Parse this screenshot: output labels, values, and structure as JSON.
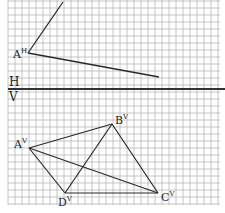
{
  "diagram": {
    "grid": {
      "x0": 8,
      "y0": 0,
      "x1": 220,
      "y1": 205,
      "step": 7,
      "color": "#b8b8b8"
    },
    "ground_line": {
      "y": 89,
      "x0": 8,
      "x1": 225,
      "color": "#333333",
      "label_top": "H",
      "label_bottom": "V"
    },
    "horizontal_view": {
      "points": {
        "A": {
          "x": 28,
          "y": 53,
          "label": "A",
          "sup": "H"
        }
      },
      "lines": [
        {
          "from": [
            28,
            53
          ],
          "to": [
            63,
            2
          ]
        },
        {
          "from": [
            28,
            53
          ],
          "to": [
            159,
            77
          ]
        }
      ]
    },
    "vertical_view": {
      "points": {
        "A": {
          "x": 29,
          "y": 148,
          "label": "A",
          "sup": "V"
        },
        "B": {
          "x": 112,
          "y": 124,
          "label": "B",
          "sup": "V"
        },
        "C": {
          "x": 158,
          "y": 193,
          "label": "C",
          "sup": "V"
        },
        "D": {
          "x": 65,
          "y": 193,
          "label": "D",
          "sup": "V"
        }
      },
      "edges": [
        [
          "A",
          "B"
        ],
        [
          "B",
          "C"
        ],
        [
          "C",
          "D"
        ],
        [
          "D",
          "A"
        ],
        [
          "A",
          "C"
        ],
        [
          "B",
          "D"
        ]
      ]
    },
    "line_color": "#2a2a2a"
  }
}
